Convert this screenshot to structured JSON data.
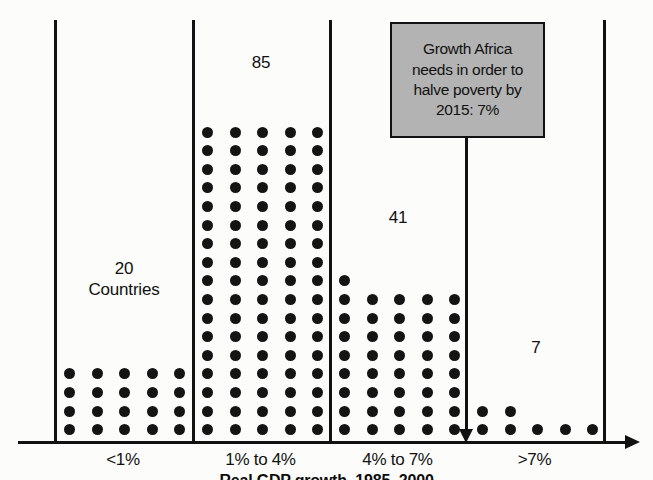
{
  "chart_data": {
    "type": "bar",
    "subtype": "dot-pictograph",
    "title": "",
    "xlabel": "Real GDP growth, 1985–2000",
    "ylabel": "",
    "unit": "Countries",
    "dots_per_row": 5,
    "grid": false,
    "legend": null,
    "categories": [
      "<1%",
      "1% to 4%",
      "4% to 7%",
      ">7%"
    ],
    "values": [
      20,
      85,
      41,
      7
    ],
    "value_labels": [
      "20\nCountries",
      "85",
      "41",
      "7"
    ],
    "annotations": [
      {
        "text": "Growth Africa needs in order to halve poverty by 2015: 7%",
        "points_to": "boundary between 4% to 7% and >7%",
        "value": 7
      }
    ]
  },
  "axis": {
    "title": "Real GDP growth, 1985–2000",
    "tick_labels": [
      "<1%",
      "1% to 4%",
      "4% to 7%",
      ">7%"
    ]
  },
  "series": [
    {
      "category": "<1%",
      "count": 20,
      "label": "20\nCountries"
    },
    {
      "category": "1% to 4%",
      "count": 85,
      "label": "85"
    },
    {
      "category": "4% to 7%",
      "count": 41,
      "label": "41"
    },
    {
      "category": ">7%",
      "count": 7,
      "label": "7"
    }
  ],
  "annotation": {
    "line1": "Growth Africa",
    "line2": "needs in order to",
    "line3": "halve poverty by",
    "line4": "2015: 7%",
    "full_text": "Growth Africa needs in order to halve poverty by 2015: 7%"
  },
  "colors": {
    "dot": "#141414",
    "axis": "#111111",
    "annotation_fill": "#b3b3b3",
    "annotation_border": "#111111",
    "background": "#fcfcfa",
    "text": "#111111"
  }
}
